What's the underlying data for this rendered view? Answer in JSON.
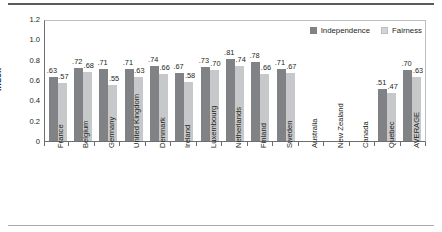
{
  "chart_data": {
    "type": "bar",
    "title": "",
    "xlabel": "",
    "ylabel": "Index",
    "ylim": [
      0,
      1.2
    ],
    "ytick_labels": [
      "1.2",
      "1.0",
      "0.8",
      "0.6",
      "0.4",
      "0.2",
      "0"
    ],
    "ytick_values": [
      1.2,
      1.0,
      0.8,
      0.6,
      0.4,
      0.2,
      0
    ],
    "grid": false,
    "legend_position": "top-right",
    "categories": [
      "France",
      "Belgium",
      "Germany",
      "United Kingdom",
      "Denmark",
      "Ireland",
      "Luxembourg",
      "Netherlands",
      "Finland",
      "Sweden",
      "Australia",
      "New Zealand",
      "Canada",
      "Quebec",
      "AVERAGE"
    ],
    "series": [
      {
        "name": "Independence",
        "color": "#808285",
        "values": [
          0.63,
          0.72,
          0.71,
          0.71,
          0.74,
          0.67,
          0.73,
          0.81,
          0.78,
          0.71,
          null,
          null,
          null,
          0.51,
          0.7
        ],
        "labels": [
          ".63",
          ".72",
          ".71",
          ".71",
          ".74",
          ".67",
          ".73",
          ".81",
          ".78",
          ".71",
          "",
          "",
          "",
          ".51",
          ".70"
        ]
      },
      {
        "name": "Fairness",
        "color": "#c7c8ca",
        "values": [
          0.57,
          0.68,
          0.55,
          0.63,
          0.66,
          0.58,
          0.7,
          0.74,
          0.66,
          0.67,
          null,
          null,
          null,
          0.47,
          0.63
        ],
        "labels": [
          ".57",
          ".68",
          ".55",
          ".63",
          ".66",
          ".58",
          ".70",
          ".74",
          ".66",
          ".67",
          "",
          "",
          "",
          ".47",
          ".63"
        ]
      }
    ]
  },
  "legend": {
    "items": [
      {
        "label": "Independence",
        "swatch": "legend-swatch-independence"
      },
      {
        "label": "Fairness",
        "swatch": "legend-swatch-fairness"
      }
    ]
  }
}
